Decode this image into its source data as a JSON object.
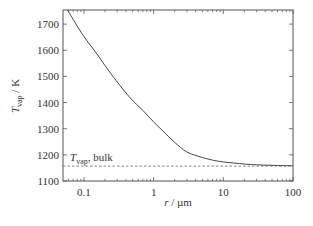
{
  "chart_data": {
    "type": "line",
    "title": "",
    "xlabel": {
      "main": "r",
      "unit": "µm"
    },
    "ylabel": {
      "main": "T",
      "sub": "vap",
      "unit": "K"
    },
    "xscale": "log",
    "xlim": [
      0.05,
      100
    ],
    "ylim": [
      1100,
      1754
    ],
    "xticks": [
      {
        "value": 0.1,
        "label": "0.1"
      },
      {
        "value": 1,
        "label": "1"
      },
      {
        "value": 10,
        "label": "10"
      },
      {
        "value": 100,
        "label": "100"
      }
    ],
    "yticks": [
      {
        "value": 1100,
        "label": "1100"
      },
      {
        "value": 1200,
        "label": "1200"
      },
      {
        "value": 1300,
        "label": "1300"
      },
      {
        "value": 1400,
        "label": "1400"
      },
      {
        "value": 1500,
        "label": "1500"
      },
      {
        "value": 1600,
        "label": "1600"
      },
      {
        "value": 1700,
        "label": "1700"
      }
    ],
    "grid": false,
    "series": [
      {
        "name": "T_vap(r)",
        "style": "solid",
        "x": [
          0.058,
          0.07,
          0.1,
          0.15,
          0.2,
          0.3,
          0.46,
          0.7,
          1,
          1.5,
          2,
          3,
          5,
          7,
          10,
          20,
          30,
          50,
          100
        ],
        "y": [
          1754,
          1718,
          1652,
          1590,
          1542,
          1479,
          1418,
          1370,
          1326,
          1280,
          1248,
          1211,
          1190,
          1180,
          1173,
          1165,
          1162,
          1160,
          1158
        ]
      }
    ],
    "reference_line": {
      "name": "T_vap, bulk",
      "style": "dashed",
      "y": 1157
    },
    "annotations": [
      {
        "text_main": "T",
        "text_sub": "vap",
        "text_rest": ", bulk",
        "x": 0.058,
        "y": 1185
      }
    ]
  }
}
